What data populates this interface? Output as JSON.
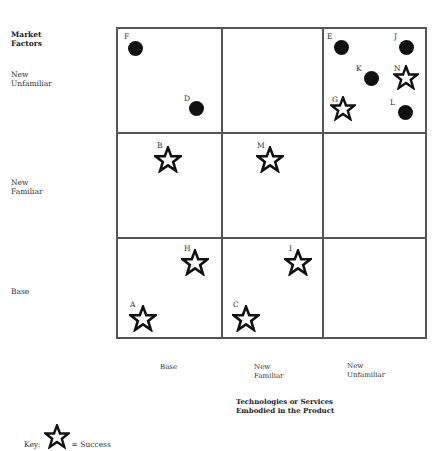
{
  "row_axis": {
    "title": "Market Factors",
    "title_lines": [
      "Market",
      "Factors"
    ],
    "rows": [
      {
        "lines": [
          "New",
          "Unfamiliar"
        ]
      },
      {
        "lines": [
          "New",
          "Familiar"
        ]
      },
      {
        "lines": [
          "Base"
        ]
      }
    ]
  },
  "col_axis": {
    "title_lines": [
      "Technologies or Services",
      "Embodied in the Product"
    ],
    "cols": [
      {
        "lines": [
          "Base"
        ]
      },
      {
        "lines": [
          "New",
          "Familiar"
        ]
      },
      {
        "lines": [
          "New",
          "Unfamiliar"
        ]
      }
    ]
  },
  "markers": [
    {
      "label": "F",
      "type": "failure",
      "row": "New Unfamiliar",
      "col": "Base"
    },
    {
      "label": "D",
      "type": "failure",
      "row": "New Unfamiliar",
      "col": "Base"
    },
    {
      "label": "E",
      "type": "failure",
      "row": "New Unfamiliar",
      "col": "New Unfamiliar"
    },
    {
      "label": "J",
      "type": "failure",
      "row": "New Unfamiliar",
      "col": "New Unfamiliar"
    },
    {
      "label": "K",
      "type": "failure",
      "row": "New Unfamiliar",
      "col": "New Unfamiliar"
    },
    {
      "label": "N",
      "type": "success",
      "row": "New Unfamiliar",
      "col": "New Unfamiliar"
    },
    {
      "label": "G",
      "type": "success",
      "row": "New Unfamiliar",
      "col": "New Unfamiliar"
    },
    {
      "label": "L",
      "type": "failure",
      "row": "New Unfamiliar",
      "col": "New Unfamiliar"
    },
    {
      "label": "B",
      "type": "success",
      "row": "New Familiar",
      "col": "Base"
    },
    {
      "label": "M",
      "type": "success",
      "row": "New Familiar",
      "col": "New Familiar"
    },
    {
      "label": "H",
      "type": "success",
      "row": "Base",
      "col": "Base"
    },
    {
      "label": "I",
      "type": "success",
      "row": "Base",
      "col": "New Familiar"
    },
    {
      "label": "A",
      "type": "success",
      "row": "Base",
      "col": "Base"
    },
    {
      "label": "C",
      "type": "success",
      "row": "Base",
      "col": "New Familiar"
    }
  ],
  "key": {
    "prefix": "Key:",
    "icon": "star-outline-icon",
    "text": "= Success"
  }
}
